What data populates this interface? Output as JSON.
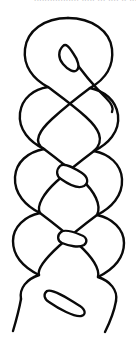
{
  "figure": {
    "style": "ink-line-art",
    "background_color": "#ffffff",
    "stroke_color": "#0a0a0a",
    "stroke_width": 2.2,
    "canvas": {
      "width": 136,
      "height": 343
    }
  },
  "scan_artifact": {
    "present": true,
    "location": "top-edge",
    "legible": false,
    "text": "................. ..... ... ....  ..  ....",
    "note": "clipped descender row of a line of text cut off by the crop"
  },
  "geometry": {
    "top_loop": {
      "name": "top-loop",
      "center_x": 68,
      "top_y": 18,
      "width": 90,
      "height": 70
    },
    "needle_eye": {
      "name": "pointed-rope-end",
      "x": 62,
      "y": 43,
      "length": 28,
      "width": 10,
      "angle_deg": 38
    },
    "tabs": [
      {
        "name": "strand-tab-upper",
        "x": 56,
        "y": 165,
        "length": 32,
        "width": 13,
        "angle_deg": 28
      },
      {
        "name": "strand-tab-middle",
        "x": 58,
        "y": 232,
        "length": 28,
        "width": 13,
        "angle_deg": 12
      },
      {
        "name": "strand-tab-lower",
        "x": 46,
        "y": 293,
        "length": 40,
        "width": 11,
        "angle_deg": 20
      }
    ],
    "tails": [
      {
        "name": "tail-left",
        "start_x": 22,
        "start_y": 300,
        "end_x": 14,
        "end_y": 330
      },
      {
        "name": "tail-right",
        "start_x": 112,
        "start_y": 300,
        "end_x": 104,
        "end_y": 331
      }
    ],
    "crossings": 5,
    "strand_count": 2
  },
  "labels": {
    "figure_caption": "",
    "alt_text": "Line drawing of a twisted rope"
  }
}
